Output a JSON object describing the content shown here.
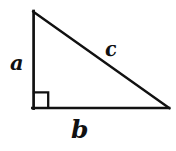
{
  "figure": {
    "kind": "right-triangle-diagram",
    "background_color": "#ffffff",
    "stroke_color": "#111111"
  },
  "geometry": {
    "apex": {
      "x": 33,
      "y": 11
    },
    "right_angle_vertex": {
      "x": 33,
      "y": 108
    },
    "base_right_vertex": {
      "x": 169,
      "y": 108
    },
    "right_angle_marker": {
      "x": 34,
      "y": 92,
      "width": 14,
      "height": 16
    },
    "stroke_width": 2.6
  },
  "labels": {
    "leg_vertical": "a",
    "leg_horizontal": "b",
    "hypotenuse": "c"
  }
}
